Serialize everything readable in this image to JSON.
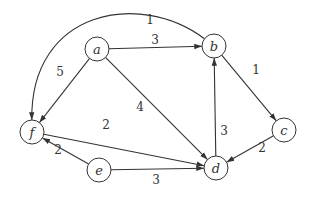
{
  "graph": {
    "directed": true,
    "nodes": [
      {
        "id": "a",
        "label": "a"
      },
      {
        "id": "b",
        "label": "b"
      },
      {
        "id": "c",
        "label": "c"
      },
      {
        "id": "d",
        "label": "d"
      },
      {
        "id": "e",
        "label": "e"
      },
      {
        "id": "f",
        "label": "f"
      }
    ],
    "edges": [
      {
        "from": "a",
        "to": "b",
        "weight": "3"
      },
      {
        "from": "a",
        "to": "f",
        "weight": "5"
      },
      {
        "from": "a",
        "to": "d",
        "weight": "4"
      },
      {
        "from": "b",
        "to": "f",
        "weight": "1"
      },
      {
        "from": "b",
        "to": "c",
        "weight": "1"
      },
      {
        "from": "c",
        "to": "d",
        "weight": "2"
      },
      {
        "from": "d",
        "to": "b",
        "weight": "3"
      },
      {
        "from": "f",
        "to": "d",
        "weight": "2"
      },
      {
        "from": "e",
        "to": "f",
        "weight": "2"
      },
      {
        "from": "e",
        "to": "d",
        "weight": "3"
      }
    ]
  }
}
